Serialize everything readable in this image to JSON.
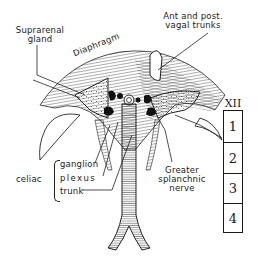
{
  "figure": {
    "type": "anatomical illustration"
  },
  "labels": {
    "suprarenal": "Suprarenal",
    "gland": "gland",
    "diaphragm": "Diaphragm",
    "vagal_line1": "Ant and post.",
    "vagal_line2": "vagal trunks",
    "celiac": "celiac",
    "ganglion": "ganglion",
    "plexus": "plexus",
    "trunk": "trunk",
    "greater": "Greater",
    "splanchnic": "splanchnic",
    "nerve": "nerve"
  },
  "vertebrae": {
    "header": "XII",
    "boxes": [
      "1",
      "2",
      "3",
      "4"
    ]
  },
  "colors": {
    "ink": "#1a1a1a",
    "background": "#ffffff"
  }
}
